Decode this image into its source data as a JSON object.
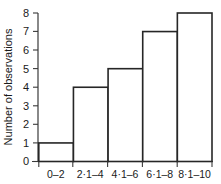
{
  "chart_data": {
    "type": "bar",
    "title": "",
    "subtitle": "",
    "xlabel": "",
    "ylabel": "Number of observations",
    "categories": [
      "0–2",
      "2·1–4",
      "4·1–6",
      "6·1–8",
      "8·1–10"
    ],
    "values": [
      1,
      4,
      5,
      7,
      8
    ],
    "ylim": [
      0,
      8
    ],
    "yticks": [
      0,
      1,
      2,
      3,
      4,
      5,
      6,
      7,
      8
    ],
    "ytick_labels": [
      "0",
      "1",
      "2",
      "3",
      "4",
      "5",
      "6",
      "7",
      "8"
    ],
    "grid": false,
    "legend": null,
    "bar_style": {
      "fill": "#ffffff",
      "edge": "#262626"
    },
    "annotations": []
  }
}
